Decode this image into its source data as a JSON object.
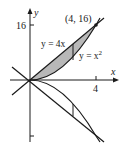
{
  "figure": {
    "axes": {
      "x_label": "x",
      "y_label": "y",
      "x_tick_label": "4",
      "y_tick_label": "16"
    },
    "curves": {
      "line_label": "y = 4x",
      "parabola_label_prefix": "y = x",
      "parabola_exponent": "2"
    },
    "point_label": "(4, 16)",
    "colors": {
      "ink": "#1a1a1a",
      "shade": "#b8b8b8"
    }
  }
}
